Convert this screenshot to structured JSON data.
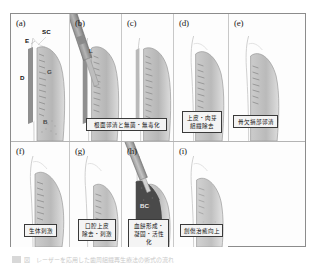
{
  "figure": {
    "bottom_caption": "図　レーザーを応用した歯周組織再生療法の術式の流れ",
    "frame_color": "#8c8c8c",
    "background": "#fdfdfd"
  },
  "anatomy_labels": {
    "enamel": "E",
    "sulcular_crevice": "SC",
    "dentin": "D",
    "granulation": "G",
    "bone": "B",
    "laser": "L",
    "blood_clot": "BC"
  },
  "panels": [
    {
      "tag": "(a)",
      "name": "initial-periodontal-pocket",
      "caption": "",
      "labels": [
        "E",
        "SC",
        "D",
        "G",
        "B"
      ]
    },
    {
      "tag": "(b)",
      "name": "root-surface-debridement-laser",
      "caption": "根面郭清と無菌・無毒化",
      "labels": [
        "L"
      ]
    },
    {
      "tag": "(c)",
      "name": "after-root-surface-treatment",
      "caption": "",
      "labels": []
    },
    {
      "tag": "(d)",
      "name": "epithelium-granulation-removal",
      "caption": "上皮・肉芽\n組織除去",
      "labels": []
    },
    {
      "tag": "(e)",
      "name": "bone-defect-debridement",
      "caption": "骨欠損部郭清",
      "labels": []
    },
    {
      "tag": "(f)",
      "name": "biological-stimulation",
      "caption": "生体刺激",
      "labels": []
    },
    {
      "tag": "(g)",
      "name": "oral-epithelium-removal-stimulation",
      "caption": "口腔上皮\n除去・刺激",
      "labels": []
    },
    {
      "tag": "(h)",
      "name": "blood-clot-formation-coagulation-activation",
      "caption": "血餅形成・\n凝固・活性化",
      "labels": [
        "BC"
      ]
    },
    {
      "tag": "(i)",
      "name": "improved-wound-healing",
      "caption": "創傷治癒向上",
      "labels": []
    }
  ]
}
